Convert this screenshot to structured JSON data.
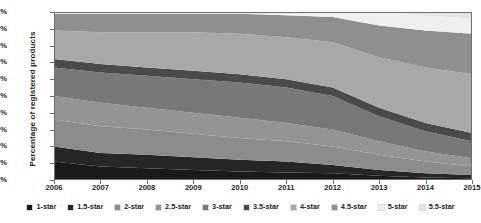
{
  "chart_data": {
    "type": "area",
    "title": "",
    "xlabel": "",
    "ylabel": "Percentage of registered products",
    "stacked": true,
    "normalized": true,
    "grid": false,
    "legend_position": "bottom",
    "ylim": [
      0,
      100
    ],
    "ytick_labels": [
      "0%",
      "10%",
      "20%",
      "30%",
      "40%",
      "50%",
      "60%",
      "70%",
      "80%",
      "90%",
      "100%"
    ],
    "ytick_values": [
      0,
      10,
      20,
      30,
      40,
      50,
      60,
      70,
      80,
      90,
      100
    ],
    "categories": [
      "2006",
      "2007",
      "2008",
      "2009",
      "2010",
      "2011",
      "2012",
      "2013",
      "2014",
      "2015"
    ],
    "x": [
      2006,
      2007,
      2008,
      2009,
      2010,
      2011,
      2012,
      2013,
      2014,
      2015
    ],
    "series": [
      {
        "name": "1-star",
        "color": "#1a1a1a",
        "values": [
          11,
          8,
          7,
          6,
          5,
          4.5,
          4,
          2.5,
          1.5,
          1
        ]
      },
      {
        "name": "1.5-star",
        "color": "#262626",
        "values": [
          9,
          8,
          8,
          7.5,
          7,
          6.5,
          5,
          3.5,
          2.5,
          2
        ]
      },
      {
        "name": "2-star",
        "color": "#8c8c8c",
        "values": [
          16,
          16,
          15,
          14,
          13,
          12,
          11,
          9,
          7,
          5
        ]
      },
      {
        "name": "2.5-star",
        "color": "#949494",
        "values": [
          14,
          14,
          13,
          12.5,
          12,
          11,
          10,
          8,
          6,
          5
        ]
      },
      {
        "name": "3-star",
        "color": "#787878",
        "values": [
          17,
          18,
          19,
          20,
          21,
          21,
          20,
          15,
          12,
          10
        ]
      },
      {
        "name": "3.5-star",
        "color": "#4a4a4a",
        "values": [
          5,
          5,
          5,
          5,
          5,
          5,
          5,
          5,
          5,
          5
        ]
      },
      {
        "name": "4-star",
        "color": "#a8a8a8",
        "values": [
          17,
          19,
          21,
          23,
          24,
          25,
          27,
          30,
          33,
          35
        ]
      },
      {
        "name": "4.5-star",
        "color": "#8f8f8f",
        "values": [
          10,
          11,
          11,
          11,
          12,
          13,
          15,
          19,
          22,
          24
        ]
      },
      {
        "name": "5-star",
        "color": "#efefef",
        "values": [
          1,
          1,
          1,
          1,
          1,
          2,
          3,
          8,
          9,
          9
        ]
      },
      {
        "name": "5.5-star",
        "color": "#e4e4e4",
        "values": [
          0,
          0,
          0,
          0,
          0,
          0,
          0,
          0,
          2,
          4
        ]
      }
    ]
  },
  "legend": {
    "items": [
      {
        "label": "1-star"
      },
      {
        "label": "1.5-star"
      },
      {
        "label": "2-star"
      },
      {
        "label": "2.5-star"
      },
      {
        "label": "3-star"
      },
      {
        "label": "3.5-star"
      },
      {
        "label": "4-star"
      },
      {
        "label": "4.5-star"
      },
      {
        "label": "5-star"
      },
      {
        "label": "5.5-star"
      }
    ]
  }
}
